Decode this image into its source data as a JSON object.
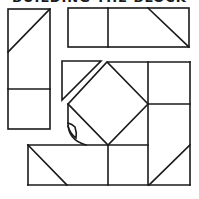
{
  "title": "BUILDING THE BLOCK",
  "colors": {
    "line": "#1a1a1a",
    "background": "#ffffff"
  },
  "pieces": [
    {
      "name": "left-strip",
      "description": "tall rectangle with half-square triangle on top and plain square below"
    },
    {
      "name": "top-strip",
      "description": "wide rectangle with square, square and half-square triangle"
    },
    {
      "name": "loose-triangle",
      "description": "single triangle separated from center"
    },
    {
      "name": "center-square-in-square",
      "description": "diamond square-in-a-square unit with a curled corner"
    },
    {
      "name": "right-column",
      "description": "square and half-square triangle rectangle on right"
    },
    {
      "name": "bottom-strip",
      "description": "rectangle with half-square triangle and two squares"
    }
  ]
}
